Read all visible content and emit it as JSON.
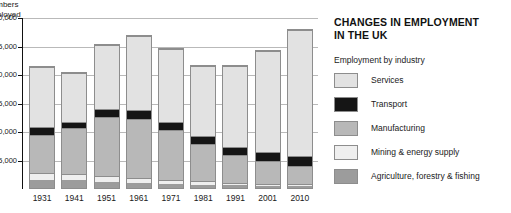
{
  "chart_data": {
    "type": "bar",
    "subtype": "stacked",
    "title": "CHANGES IN EMPLOYMENT\nIN THE UK",
    "legend_caption": "Employment by industry",
    "legend_position": "right",
    "grid": true,
    "xlabel": "",
    "ylabel": "Numbers\nemployed",
    "ylim": [
      0,
      30000
    ],
    "ytick_labels": [
      "30,000",
      "25,000",
      "20,000",
      "15,000",
      "10,000",
      "5,000"
    ],
    "ytick_values": [
      30000,
      25000,
      20000,
      15000,
      10000,
      5000
    ],
    "categories": [
      "1931",
      "1941",
      "1951",
      "1961",
      "1971",
      "1981",
      "1991",
      "2001",
      "2010"
    ],
    "series": [
      {
        "name": "Agriculture, forestry & fishing",
        "color": "#9c9c9c",
        "values": [
          1400,
          1350,
          1100,
          900,
          700,
          600,
          500,
          400,
          400
        ]
      },
      {
        "name": "Mining & energy supply",
        "color": "#efefef",
        "values": [
          1300,
          1200,
          1100,
          900,
          700,
          600,
          400,
          300,
          250
        ]
      },
      {
        "name": "Manufacturing",
        "color": "#b8b8b8",
        "values": [
          6700,
          8100,
          10400,
          10500,
          9000,
          6600,
          5000,
          4100,
          3300
        ]
      },
      {
        "name": "Transport",
        "color": "#151515",
        "values": [
          1500,
          1200,
          1400,
          1500,
          1400,
          1400,
          1500,
          1700,
          1800
        ]
      },
      {
        "name": "Services",
        "color": "#e2e2e2",
        "values": [
          10600,
          8750,
          11500,
          13200,
          12900,
          12600,
          14400,
          17900,
          22400
        ]
      }
    ],
    "totals": [
      21500,
      20600,
      25500,
      27000,
      24700,
      21800,
      21800,
      24400,
      28150
    ]
  },
  "y_axis": {
    "title": "Numbers\nemployed",
    "ticks": [
      "30,000",
      "25,000",
      "20,000",
      "15,000",
      "10,000",
      "5,000"
    ]
  },
  "x_axis": {
    "labels": [
      "1931",
      "1941",
      "1951",
      "1961",
      "1971",
      "1981",
      "1991",
      "2001",
      "2010"
    ]
  },
  "legend": {
    "caption": "Employment by industry",
    "items": [
      {
        "label": "Services",
        "color": "#e2e2e2"
      },
      {
        "label": "Transport",
        "color": "#151515"
      },
      {
        "label": "Manufacturing",
        "color": "#b8b8b8"
      },
      {
        "label": "Mining & energy supply",
        "color": "#efefef"
      },
      {
        "label": "Agriculture, forestry & fishing",
        "color": "#9c9c9c"
      }
    ]
  },
  "headline": {
    "line1": "CHANGES IN EMPLOYMENT",
    "line2": "IN THE UK",
    "full": "CHANGES IN EMPLOYMENT\nIN THE UK"
  },
  "right_column": {
    "headline_clipped": "MAI",
    "lines": [
      "Ot",
      "W",
      "Textil",
      "Non-metal miner",
      "Rubber &"
    ]
  },
  "colors": {
    "gridline": "#b9b9b9",
    "axis": "#111111",
    "bar_outline": "#8d8d8d",
    "background": "#ffffff"
  }
}
